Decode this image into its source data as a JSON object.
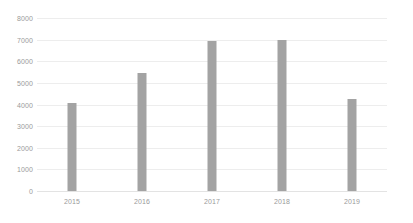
{
  "chart_data": {
    "type": "bar",
    "title": "",
    "subtitle": "",
    "xlabel": "",
    "ylabel": "",
    "categories": [
      "2015",
      "2016",
      "2017",
      "2018",
      "2019"
    ],
    "values": [
      4060,
      5440,
      6950,
      7000,
      4240
    ],
    "series": [
      {
        "name": "Series 1",
        "values": [
          4060,
          5440,
          6950,
          7000,
          4240
        ]
      }
    ],
    "ylim": [
      0,
      8000
    ],
    "y_ticks": [
      0,
      1000,
      2000,
      3000,
      4000,
      5000,
      6000,
      7000,
      8000
    ],
    "y_tick_labels": [
      "0",
      "1000",
      "2000",
      "3000",
      "4000",
      "5000",
      "6000",
      "7000",
      "8000"
    ],
    "x_tick_labels": [
      "2015",
      "2016",
      "2017",
      "2018",
      "2019"
    ],
    "grid": "horizontal",
    "legend": "none",
    "bar_color": "#a3a3a3",
    "gridline_color": "#ededed",
    "tick_label_color": "#9a9a9a",
    "background_color": "#ffffff"
  }
}
